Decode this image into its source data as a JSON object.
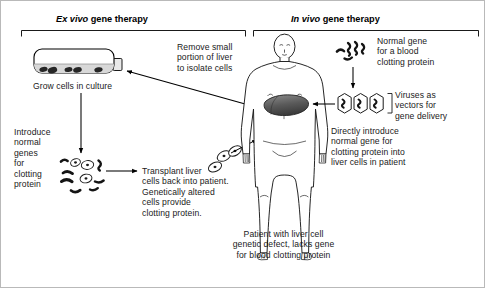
{
  "figure": {
    "type": "diagram",
    "panels": [
      {
        "id": "ex-vivo",
        "title_italic": "Ex vivo",
        "title_rest": " gene therapy"
      },
      {
        "id": "in-vivo",
        "title_italic": "In vivo",
        "title_rest": " gene therapy"
      }
    ]
  },
  "ex_vivo": {
    "header_italic": "Ex vivo",
    "header_rest": " gene therapy",
    "flask_caption": "Grow cells in culture",
    "introduce_genes": "Introduce\nnormal\ngenes\nfor\nclotting\nprotein",
    "transplant": "Transplant liver\ncells back into patient.\nGenetically altered\ncells provide\nclotting protein.",
    "remove_portion": "Remove small\nportion of liver\nto isolate cells"
  },
  "in_vivo": {
    "header_italic": "In vivo",
    "header_rest": " gene therapy",
    "normal_gene": "Normal gene\nfor a blood\nclotting protein",
    "viruses": "Viruses as\nvectors for\ngene delivery",
    "directly_introduce": "Directly introduce\nnormal gene for\nclotting protein into\nliver cells in patient",
    "patient_caption": "Patient with liver cell\ngenetic defect, lacks gene\nfor blood clotting protein"
  },
  "colors": {
    "ink": "#1a1a1a",
    "line": "#000000",
    "border": "#b9b9b9",
    "liver_fill": "#5c5c5c",
    "medium_fill": "#d2d2d2",
    "cell_dark": "#2b2b2b"
  },
  "icons": {
    "flask": "culture-flask-icon",
    "human": "human-body-icon",
    "liver": "liver-organ-icon",
    "cell": "liver-cell-icon",
    "gene": "gene-strand-icon",
    "virus": "virus-capsid-icon"
  }
}
